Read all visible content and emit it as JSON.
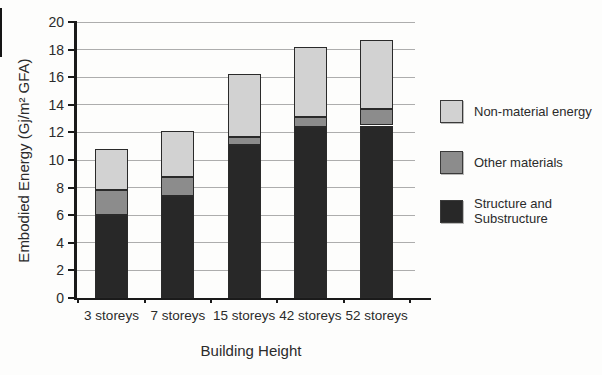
{
  "chart_data": {
    "type": "bar",
    "stacked": true,
    "title": "",
    "xlabel": "Building Height",
    "ylabel": "Embodied Energy (Gj/m² GFA)",
    "ylim": [
      0,
      20
    ],
    "y_ticks": [
      0,
      2,
      4,
      6,
      8,
      10,
      12,
      14,
      16,
      18,
      20
    ],
    "grid": true,
    "legend_position": "right",
    "categories": [
      "3 storeys",
      "7 storeys",
      "15 storeys",
      "42 storeys",
      "52 storeys"
    ],
    "series": [
      {
        "name": "Structure and Substructure",
        "color": "#282828",
        "values": [
          6.0,
          7.4,
          11.1,
          12.4,
          12.5
        ]
      },
      {
        "name": "Other materials",
        "color": "#8c8c8c",
        "values": [
          1.8,
          1.4,
          0.6,
          0.7,
          1.2
        ]
      },
      {
        "name": "Non-material energy",
        "color": "#d2d2d2",
        "values": [
          3.0,
          3.3,
          4.5,
          5.1,
          5.0
        ]
      }
    ],
    "totals": [
      10.8,
      12.1,
      16.2,
      18.2,
      18.7
    ]
  },
  "legend": {
    "items": [
      {
        "label": "Non-material energy",
        "color": "#d2d2d2"
      },
      {
        "label": "Other materials",
        "color": "#8c8c8c"
      },
      {
        "label": "Structure and Substructure",
        "color": "#282828"
      }
    ]
  },
  "colors": {
    "background": "#fdfdfc",
    "gridline": "#adadad",
    "axis": "#1a1a1a",
    "text": "#2b2b2b",
    "segment_border": "#2a2a2a"
  }
}
